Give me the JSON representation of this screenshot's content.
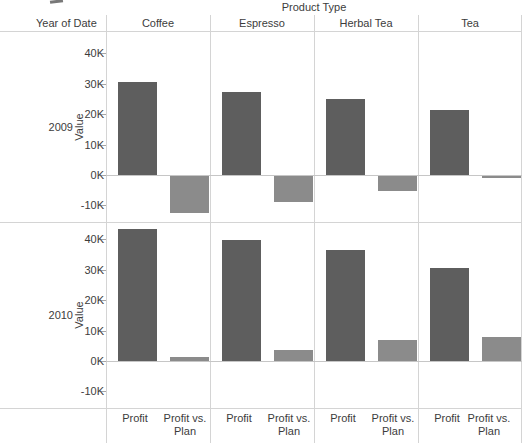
{
  "chart_data": {
    "type": "bar",
    "title": "Product Type",
    "row_field": "Year of Date",
    "ylabel": "Value",
    "rows": [
      "2009",
      "2010"
    ],
    "columns": [
      "Coffee",
      "Espresso",
      "Herbal Tea",
      "Tea"
    ],
    "measures": [
      "Profit",
      "Profit vs. Plan"
    ],
    "yticks": [
      {
        "value": 40000,
        "label": "40K"
      },
      {
        "value": 30000,
        "label": "30K"
      },
      {
        "value": 20000,
        "label": "20K"
      },
      {
        "value": 10000,
        "label": "10K"
      },
      {
        "value": 0,
        "label": "0K"
      },
      {
        "value": -10000,
        "label": "-10K"
      }
    ],
    "ylim": [
      -15500,
      47000
    ],
    "grid": "zero-line-only",
    "legend": "none",
    "values": {
      "2009": {
        "Coffee": [
          30500,
          -12200
        ],
        "Espresso": [
          27200,
          -8700
        ],
        "Herbal Tea": [
          25000,
          -4800
        ],
        "Tea": [
          21300,
          -800
        ]
      },
      "2010": {
        "Coffee": [
          43400,
          1300
        ],
        "Espresso": [
          39800,
          3600
        ],
        "Herbal Tea": [
          36500,
          6900
        ],
        "Tea": [
          30600,
          8000
        ]
      }
    },
    "bar_colors": {
      "Profit": "#5e5e5e",
      "Profit vs. Plan": "#8b8b8b"
    }
  },
  "colors": {
    "background": "#ffffff",
    "panel_border": "#d4d4d4",
    "zero_line": "#c6c6c6",
    "tick_mark": "#a6a6a6",
    "text": "#3c3c3c"
  }
}
